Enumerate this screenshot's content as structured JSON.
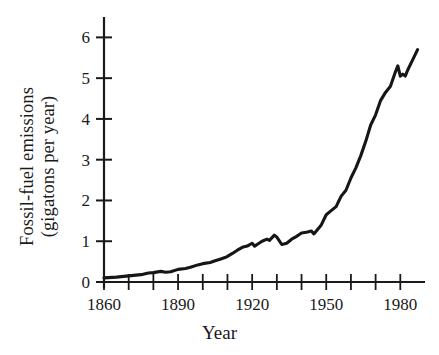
{
  "figure": {
    "background_color": "#ffffff",
    "line_color": "#161616",
    "axis_color": "#1a1a1a"
  },
  "axes": {
    "y_label_line1": "Fossil-fuel emissions",
    "y_label_line2": "(gigatons per year)",
    "x_label": "Year",
    "y_ticks": [
      "0",
      "1",
      "2",
      "3",
      "4",
      "5",
      "6"
    ],
    "x_ticks": [
      "1860",
      "1890",
      "1920",
      "1950",
      "1980"
    ]
  },
  "chart_data": {
    "type": "line",
    "title": "",
    "xlabel": "Year",
    "ylabel": "Fossil-fuel emissions (gigatons per year)",
    "xlim": [
      1860,
      1990
    ],
    "ylim": [
      0,
      6.5
    ],
    "xticks": [
      1860,
      1890,
      1920,
      1950,
      1980
    ],
    "xticks_minor_step": 10,
    "yticks": [
      0,
      1,
      2,
      3,
      4,
      5,
      6
    ],
    "grid": false,
    "legend": null,
    "series": [
      {
        "name": "Fossil-fuel emissions",
        "color": "#161616",
        "x": [
          1860,
          1865,
          1870,
          1875,
          1878,
          1880,
          1883,
          1885,
          1887,
          1890,
          1893,
          1895,
          1898,
          1900,
          1903,
          1905,
          1907,
          1909,
          1910,
          1912,
          1914,
          1916,
          1918,
          1920,
          1921,
          1922,
          1924,
          1926,
          1927,
          1929,
          1930,
          1932,
          1934,
          1936,
          1938,
          1940,
          1942,
          1944,
          1945,
          1946,
          1948,
          1950,
          1952,
          1954,
          1956,
          1958,
          1960,
          1962,
          1964,
          1966,
          1968,
          1970,
          1972,
          1974,
          1976,
          1978,
          1979,
          1980,
          1981,
          1982,
          1983,
          1985,
          1987
        ],
        "y": [
          0.1,
          0.12,
          0.15,
          0.18,
          0.22,
          0.23,
          0.26,
          0.24,
          0.25,
          0.31,
          0.33,
          0.36,
          0.42,
          0.45,
          0.48,
          0.52,
          0.56,
          0.6,
          0.63,
          0.7,
          0.78,
          0.85,
          0.88,
          0.95,
          0.88,
          0.92,
          1.0,
          1.05,
          1.02,
          1.15,
          1.1,
          0.92,
          0.95,
          1.05,
          1.12,
          1.2,
          1.22,
          1.25,
          1.18,
          1.25,
          1.4,
          1.65,
          1.75,
          1.85,
          2.1,
          2.25,
          2.55,
          2.8,
          3.1,
          3.45,
          3.85,
          4.1,
          4.45,
          4.65,
          4.8,
          5.15,
          5.3,
          5.05,
          5.1,
          5.05,
          5.2,
          5.45,
          5.7
        ]
      }
    ]
  }
}
